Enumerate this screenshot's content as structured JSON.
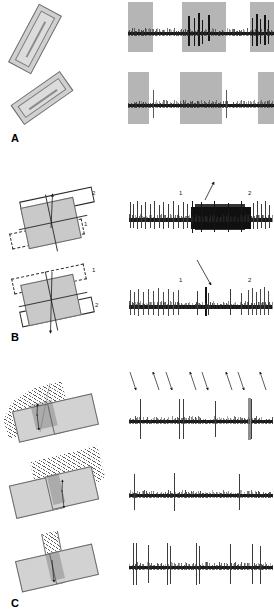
{
  "figure": {
    "type": "electrophysiology-figure",
    "width_px": 274,
    "height_px": 614,
    "background_color": "#ffffff",
    "ink_color": "#151515",
    "shade_color": "#b5b5b5",
    "stimulus_fill": "#d0d0d0"
  },
  "panels": [
    {
      "id": "A",
      "label": "A",
      "label_position": {
        "x": 11,
        "y": 133
      },
      "description": "Elongated bar stimulus presented at two orientations; spike trains recorded during three shaded stimulus epochs.",
      "stimuli": [
        {
          "name": "tilted-bar-steep",
          "orientation_deg": -62,
          "label": "",
          "fill": "#d0d0d0",
          "outline": "#6d6d6d"
        },
        {
          "name": "tilted-bar-shallow",
          "orientation_deg": -35,
          "label": "",
          "fill": "#d0d0d0",
          "outline": "#6d6d6d"
        }
      ],
      "traces": [
        {
          "name": "trace-a-top",
          "spike_count": 9,
          "shaded_epochs": 3,
          "note": "Strong burst of spikes during 2nd and 3rd shaded epochs"
        },
        {
          "name": "trace-a-bottom",
          "spike_count": 2,
          "shaded_epochs": 3,
          "note": "Only two isolated spikes; weak response"
        }
      ]
    },
    {
      "id": "B",
      "label": "B",
      "label_position": {
        "x": 11,
        "y": 333
      },
      "description": "Two bars (1 and 2) moved relative to a central square; arrow marks direction of motion. Responses show vigorous discharge or suppression.",
      "stimuli": [
        {
          "name": "two-bar-up-arrow",
          "bar_solid_label": "2",
          "bar_dashed_label": "1",
          "arrow_direction": "up",
          "square_fill": "#c9c9c9"
        },
        {
          "name": "two-bar-down-arrow",
          "bar_dashed_label": "1",
          "bar_solid_label": "2",
          "arrow_direction": "down",
          "square_fill": "#c9c9c9"
        }
      ],
      "traces": [
        {
          "name": "trace-b-top",
          "marker_labels": [
            "1",
            "2"
          ],
          "arrow_annotation": true,
          "note": "Dense high-frequency burst between markers 1 and 2"
        },
        {
          "name": "trace-b-bottom",
          "marker_labels": [
            "1",
            "2"
          ],
          "arrow_annotation": true,
          "note": "Activity suppressed between markers 1 and 2; sparse spikes"
        }
      ]
    },
    {
      "id": "C",
      "label": "C",
      "label_position": {
        "x": 11,
        "y": 599
      },
      "description": "Hatched moving edge sweeping across overlapping gray fields at three different configurations; arrows indicate alternating sweep directions.",
      "stimuli": [
        {
          "name": "edge-wide-oblique",
          "hatch_angle_deg": 45,
          "arrow_pair": "up-down"
        },
        {
          "name": "edge-narrow-oblique",
          "hatch_angle_deg": 45,
          "arrow_pair": "up-down"
        },
        {
          "name": "edge-narrow-vertical",
          "hatch_angle_deg": 45,
          "arrow_pair": "down"
        }
      ],
      "traces": [
        {
          "name": "trace-c-top",
          "arrow_count": 8,
          "arrow_directions": [
            "down-left",
            "up-right",
            "down-left",
            "up-right",
            "down-left",
            "up-right",
            "down-left",
            "up-right"
          ],
          "spike_count": 6,
          "note": "Responses only to one sweep direction"
        },
        {
          "name": "trace-c-middle",
          "arrow_count": 0,
          "spike_count": 3,
          "note": "Three large isolated spikes"
        },
        {
          "name": "trace-c-bottom",
          "arrow_count": 0,
          "spike_count": 10,
          "note": "Paired spikes at each sweep"
        }
      ]
    }
  ],
  "annotations": {
    "b_top_labels": [
      "1",
      "2"
    ],
    "b_bottom_labels": [
      "1",
      "2"
    ],
    "b_diagram_top_labels": [
      "2",
      "1"
    ],
    "b_diagram_bottom_labels": [
      "1",
      "2"
    ]
  }
}
